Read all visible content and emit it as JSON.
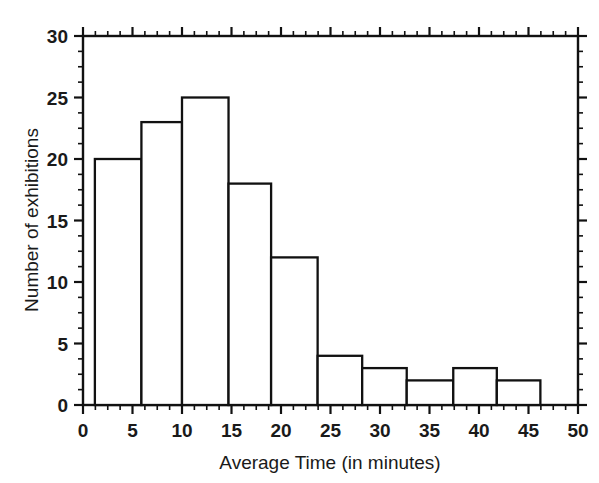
{
  "chart_data": {
    "type": "bar",
    "title": "",
    "subtitle": "",
    "xlabel": "Average Time (in minutes)",
    "ylabel": "Number of exhibitions",
    "xlim": [
      0,
      50
    ],
    "ylim": [
      0,
      30
    ],
    "grid": false,
    "legend": null,
    "bin_width": 4.7,
    "x_tick_labels": [
      "0",
      "5",
      "10",
      "15",
      "20",
      "25",
      "30",
      "35",
      "40",
      "45",
      "50"
    ],
    "x_tick_values": [
      0,
      5,
      10,
      15,
      20,
      25,
      30,
      35,
      40,
      45,
      50
    ],
    "x_minor_tick_step": 1.25,
    "y_tick_labels": [
      "0",
      "5",
      "10",
      "15",
      "20",
      "25",
      "30"
    ],
    "y_tick_values": [
      0,
      5,
      10,
      15,
      20,
      25,
      30
    ],
    "y_minor_tick_step": 1.25,
    "bins": [
      {
        "start": 1.2,
        "end": 5.9,
        "value": 20
      },
      {
        "start": 5.9,
        "end": 10.0,
        "value": 23
      },
      {
        "start": 10.0,
        "end": 14.7,
        "value": 25
      },
      {
        "start": 14.7,
        "end": 19.0,
        "value": 18
      },
      {
        "start": 19.0,
        "end": 23.7,
        "value": 12
      },
      {
        "start": 23.7,
        "end": 28.2,
        "value": 4
      },
      {
        "start": 28.2,
        "end": 32.7,
        "value": 3
      },
      {
        "start": 32.7,
        "end": 37.4,
        "value": 2
      },
      {
        "start": 37.4,
        "end": 41.8,
        "value": 3
      },
      {
        "start": 41.8,
        "end": 46.2,
        "value": 2
      }
    ],
    "categories": [
      "1.2-5.9",
      "5.9-10.0",
      "10.0-14.7",
      "14.7-19.0",
      "19.0-23.7",
      "23.7-28.2",
      "28.2-32.7",
      "32.7-37.4",
      "37.4-41.8",
      "41.8-46.2"
    ],
    "values": [
      20,
      23,
      25,
      18,
      12,
      4,
      3,
      2,
      3,
      2
    ],
    "colors": {
      "bar_fill": "#ffffff",
      "bar_stroke": "#111111",
      "axis": "#111111",
      "text": "#1a1a1a",
      "background": "#ffffff"
    }
  }
}
